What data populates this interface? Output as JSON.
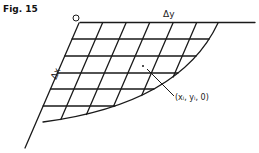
{
  "figure": {
    "title": "Fig. 15",
    "labels": {
      "delta_y": "Δy",
      "delta_x": "Δx",
      "point": "(xᵢ, yᵢ, 0)"
    },
    "origin_marker": "circle",
    "grid": {
      "horizontal_lines": 6,
      "slanted_lines": 7,
      "boundary": "curved"
    },
    "stroke_color": "#1a1a1a"
  }
}
